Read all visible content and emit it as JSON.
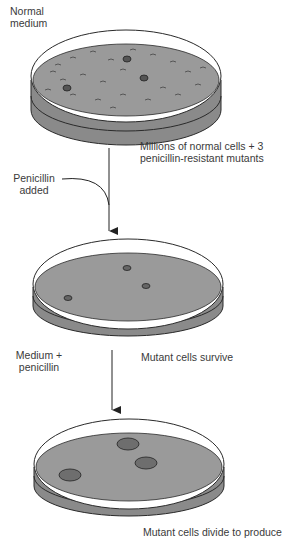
{
  "labels": {
    "normal_medium": [
      "Normal",
      "medium"
    ],
    "millions_cells": [
      "Millions of normal cells  + 3",
      "penicillin-resistant mutants"
    ],
    "penicillin_added": [
      "Penicillin",
      "added"
    ],
    "medium_penicillin": [
      "Medium  +",
      "penicillin"
    ],
    "mutant_survive": "Mutant cells survive",
    "mutant_divide": "Mutant cells divide to produce"
  },
  "colors": {
    "medium_fill": "#9a9a9a",
    "wall_fill": "#8a8a8a",
    "colony_fill": "#6e6e6e",
    "outline": "#2a2a2a"
  },
  "dishes": [
    {
      "name": "dish-1-normal-medium",
      "colonies": 3,
      "background_cells": "millions"
    },
    {
      "name": "dish-2-penicillin-added",
      "colonies": 3
    },
    {
      "name": "dish-3-mutant-colonies",
      "colonies": 3
    }
  ]
}
